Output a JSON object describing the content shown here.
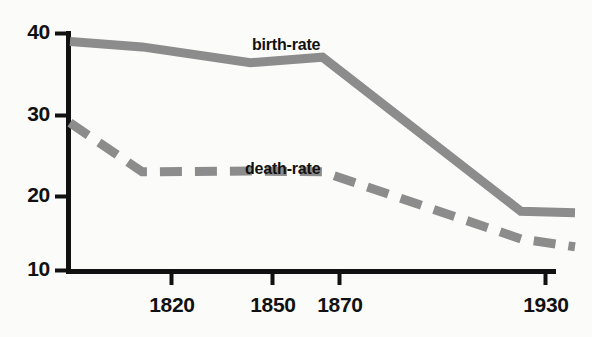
{
  "chart_data": {
    "type": "line",
    "title": "",
    "subtitle": "",
    "xlabel": "",
    "ylabel": "",
    "xlim": [
      1800,
      1940
    ],
    "ylim": [
      10,
      41
    ],
    "grid": false,
    "legend_position": "inline-labels",
    "y_ticks": [
      40,
      30,
      20,
      10
    ],
    "y_tick_labels": [
      "40",
      "30",
      "20",
      "10"
    ],
    "x_ticks": [
      1820,
      1850,
      1870,
      1930
    ],
    "x_tick_labels": [
      "1820",
      "1850",
      "1870",
      "1930"
    ],
    "series": [
      {
        "name": "birth-rate",
        "label": "birth-rate",
        "style": "solid",
        "color": "#8c8c8c",
        "x": [
          1800,
          1820,
          1850,
          1870,
          1925,
          1940
        ],
        "values": [
          39.0,
          38.3,
          36.3,
          37.0,
          17.5,
          17.3
        ]
      },
      {
        "name": "death-rate",
        "label": "death-rate",
        "style": "dashed",
        "color": "#8c8c8c",
        "x": [
          1800,
          1820,
          1850,
          1870,
          1925,
          1940
        ],
        "values": [
          28.7,
          22.5,
          22.6,
          22.5,
          14.0,
          13.0
        ]
      }
    ]
  },
  "axis": {
    "color": "#111111",
    "y_labels": [
      "40",
      "30",
      "20",
      "10"
    ],
    "x_labels": [
      "1820",
      "1850",
      "1870",
      "1930"
    ]
  },
  "labels": {
    "birth_rate": "birth-rate",
    "death_rate": "death-rate"
  },
  "colors": {
    "background": "#fbfbf9",
    "axis": "#111111",
    "series_gray": "#8c8c8c"
  }
}
